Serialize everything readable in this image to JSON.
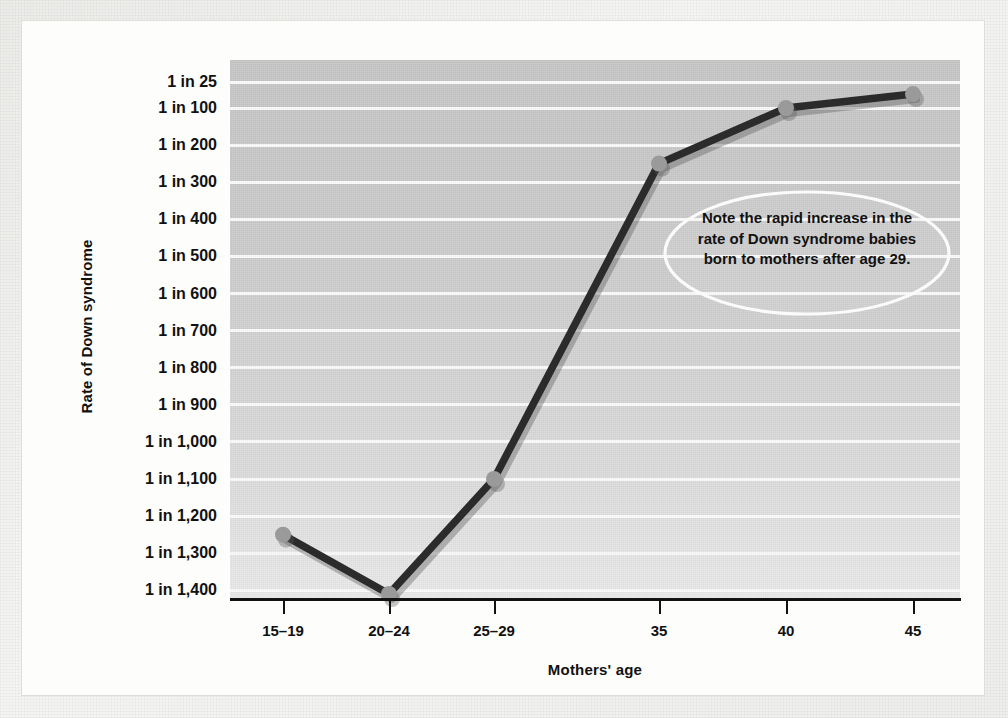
{
  "figure": {
    "y_axis_title": "Rate of Down syndrome",
    "x_axis_title": "Mothers' age",
    "annotation": "Note the rapid increase in the rate of Down syndrome babies born to mothers after age 29."
  },
  "chart_data": {
    "type": "line",
    "title": "",
    "xlabel": "Mothers' age",
    "ylabel": "Rate of Down syndrome",
    "categories": [
      "15–19",
      "20–24",
      "25–29",
      "35",
      "40",
      "45"
    ],
    "y_tick_labels": [
      "1 in 25",
      "1 in 100",
      "1 in 200",
      "1 in 300",
      "1 in 400",
      "1 in 500",
      "1 in 600",
      "1 in 700",
      "1 in 800",
      "1 in 900",
      "1 in 1,000",
      "1 in 1,100",
      "1 in 1,200",
      "1 in 1,300",
      "1 in 1,400"
    ],
    "y_tick_values": [
      25,
      100,
      200,
      300,
      400,
      500,
      600,
      700,
      800,
      900,
      1000,
      1100,
      1200,
      1300,
      1400
    ],
    "y_axis_inverted": true,
    "grid": "horizontal",
    "legend": "none",
    "series": [
      {
        "name": "Rate of Down syndrome",
        "denominators": [
          1250,
          1410,
          1100,
          250,
          100,
          60
        ],
        "labels": [
          "1 in 1,250",
          "1 in 1,410",
          "1 in 1,100",
          "1 in 250",
          "1 in 100",
          "1 in 60"
        ],
        "line_color": "#2b2b2b",
        "marker_color": "#9a9a9a"
      }
    ],
    "annotations": [
      {
        "text": "Note the rapid increase in the rate of Down syndrome babies born to mothers after age 29.",
        "shape": "ellipse"
      }
    ]
  },
  "colors": {
    "plot_background": "#cfcfcf",
    "gridline": "#fbfbfb",
    "axis": "#111111",
    "line": "#2b2b2b",
    "marker": "#9a9a9a",
    "page": "#f4f4f2"
  }
}
